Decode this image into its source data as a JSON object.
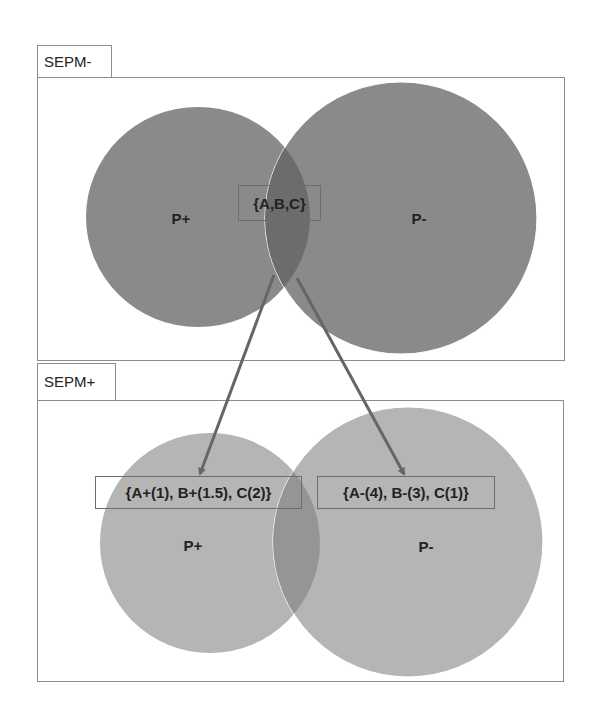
{
  "diagram": {
    "colors": {
      "top_circle": "#8a8a8a",
      "top_overlap": "#6c6c6c",
      "bottom_circle": "#b5b5b5",
      "bottom_overlap": "#959595",
      "arrow": "#666666",
      "border": "#8c8c8c"
    },
    "top_panel": {
      "tab_label": "SEPM-",
      "circle_left_label": "P+",
      "circle_right_label": "P-",
      "intersection_label": "{A,B,C}"
    },
    "bottom_panel": {
      "tab_label": "SEPM+",
      "circle_left_label": "P+",
      "circle_right_label": "P-",
      "left_set_label": "{A+(1), B+(1.5), C(2)}",
      "right_set_label": "{A-(4), B-(3), C(1)}"
    },
    "arrows": [
      {
        "from": "{A,B,C}",
        "to": "{A+(1), B+(1.5), C(2)}"
      },
      {
        "from": "{A,B,C}",
        "to": "{A-(4), B-(3), C(1)}"
      }
    ]
  }
}
